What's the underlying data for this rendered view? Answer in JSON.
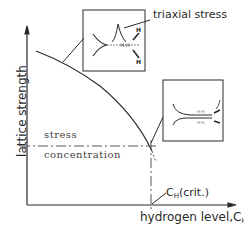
{
  "diagram": {
    "y_axis_label": "lattice strength",
    "x_axis_label": "hydrogen level,C",
    "x_axis_subscript": "H",
    "curve_label": "lattice strength vs hydrogen level (decreasing)",
    "horizontal_line_label_top": "stress",
    "horizontal_line_label_bottom": "concentration",
    "critical_label": "C",
    "critical_subscript": "H",
    "critical_suffix": "(crit.)",
    "inset_top_label": "triaxial stress",
    "inset_top_atoms": [
      "H",
      "H",
      "H"
    ],
    "colors": {
      "line": "#2a2a2a",
      "background": "#ffffff",
      "dash": "#555555"
    }
  }
}
